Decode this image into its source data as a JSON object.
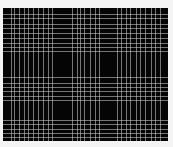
{
  "image": {
    "description": "Black plaid grid pattern of thin light lines",
    "background_color": "#050505",
    "line_color": "#d2d2d2",
    "page_color": "#f4f4f4",
    "canvas": {
      "left": 3,
      "top": 8,
      "width": 165,
      "height": 133
    },
    "vertical_lines_x": [
      11,
      14,
      19,
      24,
      28,
      33,
      38,
      43,
      48,
      52,
      72,
      77,
      80,
      84,
      90,
      95,
      99,
      117,
      121,
      126,
      130,
      136,
      140,
      145,
      151,
      155,
      160
    ],
    "horizontal_lines_y": [
      14,
      18,
      24,
      28,
      33,
      38,
      43,
      47,
      51,
      77,
      83,
      87,
      91,
      96,
      100,
      120,
      124,
      129,
      133,
      137
    ]
  }
}
